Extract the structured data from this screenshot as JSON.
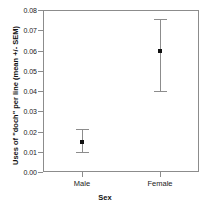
{
  "chart_data": {
    "type": "scatter",
    "title": "",
    "xlabel": "Sex",
    "ylabel": "Uses of \"doch\" per line (mean +/- SEM)",
    "categories": [
      "Male",
      "Female"
    ],
    "values": [
      0.015,
      0.06
    ],
    "error_low": [
      0.01,
      0.04
    ],
    "error_high": [
      0.021,
      0.0755
    ],
    "ylim": [
      0.0,
      0.08
    ],
    "yticks": [
      "0.00",
      "0.01",
      "0.02",
      "0.03",
      "0.04",
      "0.05",
      "0.06",
      "0.07",
      "0.08"
    ],
    "ytick_values": [
      0.0,
      0.01,
      0.02,
      0.03,
      0.04,
      0.05,
      0.06,
      0.07,
      0.08
    ],
    "grid": false,
    "legend": "none",
    "marker": "filled-square",
    "error_bar_style": "capped",
    "axis_color": "#8c8c8c",
    "marker_color": "#111111",
    "background": "#ffffff"
  }
}
